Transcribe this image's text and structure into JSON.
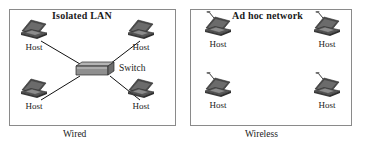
{
  "figure": {
    "panels": [
      {
        "id": "wired",
        "title": "Isolated LAN",
        "caption": "Wired",
        "nodes": [
          {
            "label": "Host",
            "icon": "laptop-icon"
          },
          {
            "label": "Host",
            "icon": "laptop-icon"
          },
          {
            "label": "Host",
            "icon": "laptop-icon"
          },
          {
            "label": "Host",
            "icon": "laptop-icon"
          }
        ],
        "central_device": {
          "label": "Switch",
          "icon": "switch-icon"
        }
      },
      {
        "id": "wireless",
        "title": "Ad hoc network",
        "caption": "Wireless",
        "nodes": [
          {
            "label": "Host",
            "icon": "wireless-laptop-icon"
          },
          {
            "label": "Host",
            "icon": "wireless-laptop-icon"
          },
          {
            "label": "Host",
            "icon": "wireless-laptop-icon"
          },
          {
            "label": "Host",
            "icon": "wireless-laptop-icon"
          }
        ]
      }
    ]
  },
  "colors": {
    "panel_border": "#8a8a8a",
    "link_line": "#111111",
    "laptop_dark": "#3d3d3d",
    "laptop_mid": "#6e6e6e",
    "laptop_light": "#9a9a9a",
    "switch_fill": "#9e9e9e",
    "text": "#1a1a1a",
    "background": "#ffffff"
  }
}
